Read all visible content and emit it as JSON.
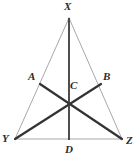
{
  "figure": {
    "kind": "geometry-diagram",
    "name": "triangle-xyz-with-cevians",
    "canvas": {
      "width": 139,
      "height": 162
    },
    "background_color": "#ffffff",
    "stroke_colors": {
      "triangle_sides": "#a8a8a8",
      "cevians": "#333333",
      "median": "#3b3b3b",
      "label_text": "#2b2b2b"
    },
    "stroke_widths": {
      "triangle_sides": 1,
      "cevians": 2.2,
      "median": 1.8
    },
    "points": {
      "X": {
        "label": "X",
        "x": 69,
        "y": 18,
        "role": "apex-vertex"
      },
      "Y": {
        "label": "Y",
        "x": 15,
        "y": 139,
        "role": "base-left-vertex"
      },
      "Z": {
        "label": "Z",
        "x": 122,
        "y": 139,
        "role": "base-right-vertex"
      },
      "A": {
        "label": "A",
        "x": 40,
        "y": 84,
        "role": "point-on-side-XY"
      },
      "B": {
        "label": "B",
        "x": 101,
        "y": 84,
        "role": "point-on-side-XZ"
      },
      "C": {
        "label": "C",
        "x": 68,
        "y": 98,
        "role": "intersection-point"
      },
      "D": {
        "label": "D",
        "x": 69,
        "y": 139,
        "role": "foot-on-base-YZ"
      }
    },
    "segments": [
      {
        "name": "side-XY",
        "from": "X",
        "to": "Y",
        "style": "thin-gray"
      },
      {
        "name": "side-XZ",
        "from": "X",
        "to": "Z",
        "style": "thin-gray"
      },
      {
        "name": "side-YZ",
        "from": "Y",
        "to": "Z",
        "style": "thin-gray"
      },
      {
        "name": "median-XD",
        "from": "X",
        "to": "D",
        "style": "thick-dark"
      },
      {
        "name": "cevian-YB",
        "from": "Y",
        "to": "B",
        "style": "thick-dark"
      },
      {
        "name": "cevian-AZ",
        "from": "A",
        "to": "Z",
        "style": "thick-dark"
      }
    ],
    "labels": {
      "X": "X",
      "A": "A",
      "B": "B",
      "C": "C",
      "Y": "Y",
      "Z": "Z",
      "D": "D"
    }
  }
}
